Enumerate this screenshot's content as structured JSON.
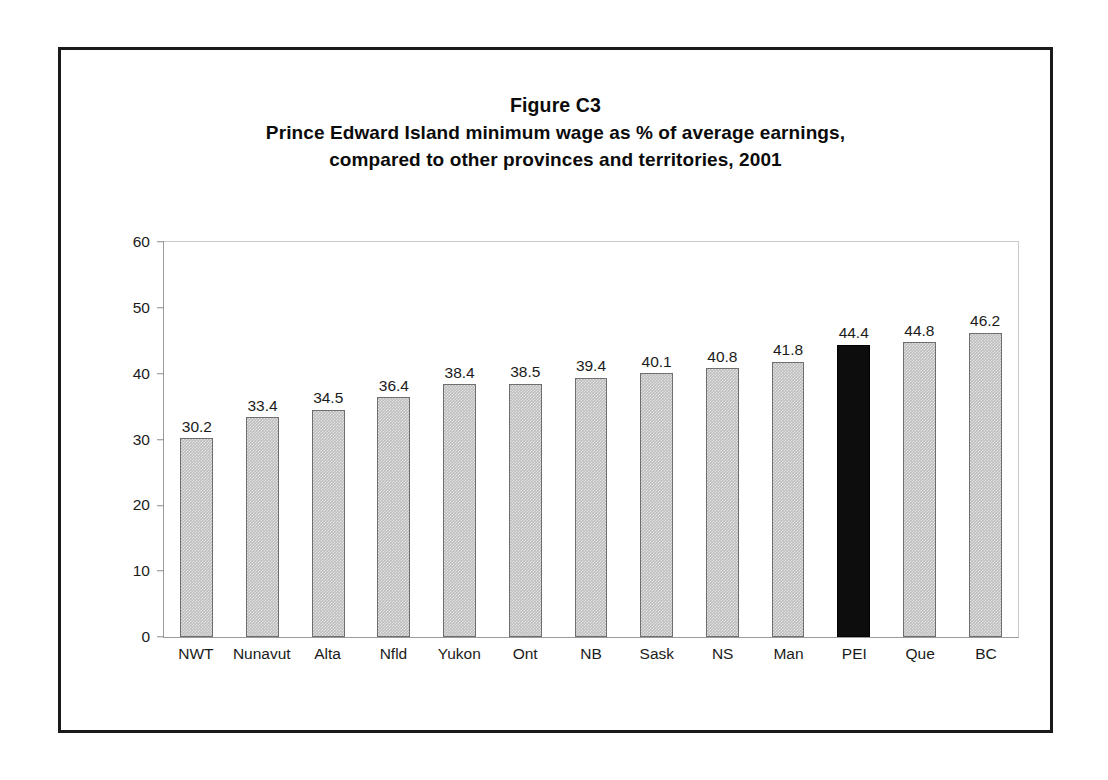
{
  "figure": {
    "title_lines": [
      "Figure C3",
      "Prince Edward Island minimum wage as % of average earnings,",
      "compared to other provinces and territories, 2001"
    ]
  },
  "chart_data": {
    "type": "bar",
    "xlabel": "",
    "ylabel": "",
    "ylim": [
      0,
      60
    ],
    "yticks": [
      "0",
      "10",
      "20",
      "30",
      "40",
      "50",
      "60"
    ],
    "grid": false,
    "legend": "none",
    "categories": [
      "NWT",
      "Nunavut",
      "Alta",
      "Nfld",
      "Yukon",
      "Ont",
      "NB",
      "Sask",
      "NS",
      "Man",
      "PEI",
      "Que",
      "BC"
    ],
    "values": [
      30.2,
      33.4,
      34.5,
      36.4,
      38.4,
      38.5,
      39.4,
      40.1,
      40.8,
      41.8,
      44.4,
      44.8,
      46.2
    ],
    "value_labels": [
      "30.2",
      "33.4",
      "34.5",
      "36.4",
      "38.4",
      "38.5",
      "39.4",
      "40.1",
      "40.8",
      "41.8",
      "44.4",
      "44.8",
      "46.2"
    ],
    "highlight_category": "PEI",
    "colors": {
      "bar_fill": "#bdbdbd",
      "bar_border": "#6e6e6e",
      "highlight_fill": "#0d0d0d",
      "axis": "#9b9b9b",
      "text": "#1b1b1b",
      "frame": "#1a1a1a"
    }
  }
}
